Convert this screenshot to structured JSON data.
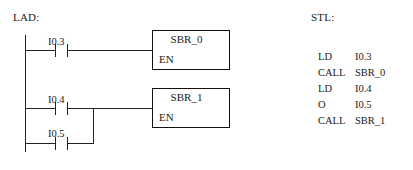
{
  "lad": {
    "label": "LAD:",
    "rungs": [
      {
        "contacts": [
          {
            "operand": "I0.3",
            "type": "normally-open"
          }
        ],
        "block": {
          "title": "SBR_0",
          "enable_label": "EN"
        }
      },
      {
        "contacts": [
          {
            "operand": "I0.4",
            "type": "normally-open"
          },
          {
            "operand": "I0.5",
            "type": "normally-open"
          }
        ],
        "block": {
          "title": "SBR_1",
          "enable_label": "EN"
        }
      }
    ]
  },
  "stl": {
    "label": "STL:",
    "instructions": [
      {
        "op": "LD",
        "arg": "I0.3"
      },
      {
        "op": "CALL",
        "arg": "SBR_0"
      },
      {
        "op": "LD",
        "arg": "I0.4"
      },
      {
        "op": "O",
        "arg": "I0.5"
      },
      {
        "op": "CALL",
        "arg": "SBR_1"
      }
    ]
  },
  "colors": {
    "line": "#222222",
    "text": "#1a1a1a",
    "background": "#ffffff"
  }
}
